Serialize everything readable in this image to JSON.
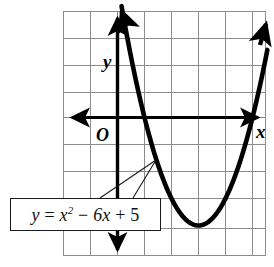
{
  "figure": {
    "title": "",
    "axis_labels": {
      "x": "x",
      "y": "y",
      "origin": "O"
    },
    "equation_label": {
      "full": "y = x² − 6x + 5",
      "lhs": "y",
      "equals": "=",
      "term1_base": "x",
      "term1_exp": "2",
      "minus": "−",
      "term2": "6x",
      "plus": "+",
      "term3": "5"
    },
    "colors": {
      "curve": "#000000",
      "axis": "#000000",
      "grid": "#8c8c8c",
      "background": "#ffffff",
      "callout_border": "#1a1a1a",
      "callout_fill": "#ffffff"
    }
  },
  "chart_data": {
    "type": "line",
    "title": "",
    "subtitle": "",
    "xlabel": "x",
    "ylabel": "y",
    "equation": "y = x^2 - 6x + 5",
    "grid": true,
    "legend": null,
    "xlim": [
      -2,
      5.5
    ],
    "ylim": [
      -5.2,
      4
    ],
    "xticks": [
      -2,
      -1,
      0,
      1,
      2,
      3,
      4,
      5
    ],
    "yticks": [
      -5,
      -4,
      -3,
      -2,
      -1,
      0,
      1,
      2,
      3,
      4
    ],
    "grid_spacing": 1,
    "roots": [
      1,
      5
    ],
    "vertex": [
      3,
      -4
    ],
    "y_intercept": 5,
    "x": [
      -0.2,
      0,
      0.5,
      1,
      1.5,
      2,
      2.5,
      3,
      3.5,
      4,
      4.5,
      5,
      5.5,
      5.8
    ],
    "y": [
      6.24,
      5,
      2.25,
      0,
      -1.75,
      -3,
      -3.75,
      -4,
      -3.75,
      -3,
      -1.75,
      0,
      2.25,
      3.84
    ],
    "series": [
      {
        "name": "y = x^2 - 6x + 5",
        "values": [
          6.24,
          5,
          2.25,
          0,
          -1.75,
          -3,
          -3.75,
          -4,
          -3.75,
          -3,
          -1.75,
          0,
          2.25,
          3.84
        ]
      }
    ],
    "annotations": [
      {
        "text": "y = x² − 6x + 5",
        "points_to": [
          1.4,
          -1.6
        ]
      },
      {
        "text": "O",
        "points_to": [
          0,
          0
        ]
      }
    ]
  }
}
